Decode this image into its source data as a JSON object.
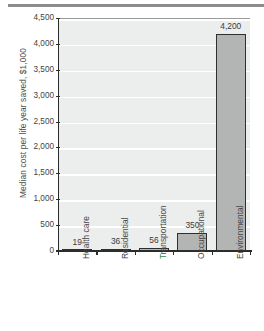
{
  "chart_data": {
    "type": "bar",
    "title": "",
    "xlabel": "",
    "ylabel": "Median cost per life year saved, $1,000",
    "ylim": [
      0,
      4500
    ],
    "grid": true,
    "legend": "none",
    "categories": [
      "Health care",
      "Residential",
      "Transportation",
      "Occupational",
      "Environmental"
    ],
    "values": [
      19,
      36,
      56,
      350,
      4200
    ],
    "value_labels": [
      "19",
      "36",
      "56",
      "350",
      "4,200"
    ],
    "ytick_labels": [
      "0",
      "500",
      "1,000",
      "1,500",
      "2,000",
      "2,500",
      "3,000",
      "3,500",
      "4,000",
      "4,500"
    ],
    "ytick_values": [
      0,
      500,
      1000,
      1500,
      2000,
      2500,
      3000,
      3500,
      4000,
      4500
    ],
    "bar_fill_color": "#b3b4b4",
    "bar_edge_color": "#2f2f2f",
    "plot_background_color": "#eceded",
    "gridline_color": "#ffffff",
    "axis_color": "#2b2b2b",
    "label_color": "#464646",
    "accent_color": "#2f8a4e"
  }
}
